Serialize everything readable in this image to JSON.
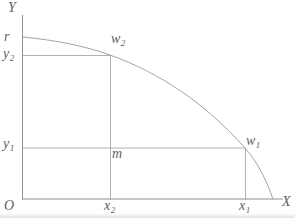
{
  "figure": {
    "background": "#ffffff",
    "axis_color": "#8f8f8f",
    "guide_color": "#9e9e9e",
    "curve_color": "#9a9a9a",
    "text_color": "#5f5f5f",
    "labels": {
      "y_axis": {
        "base": "Y",
        "sub": ""
      },
      "x_axis": {
        "base": "X",
        "sub": ""
      },
      "origin": {
        "base": "O",
        "sub": ""
      },
      "r_intercept": {
        "base": "r",
        "sub": ""
      },
      "y2": {
        "base": "y",
        "sub": "2"
      },
      "y1": {
        "base": "y",
        "sub": "1"
      },
      "x2": {
        "base": "x",
        "sub": "2"
      },
      "x1": {
        "base": "x",
        "sub": "1"
      },
      "w2": {
        "base": "w",
        "sub": "2"
      },
      "w1": {
        "base": "w",
        "sub": "1"
      },
      "m": {
        "base": "m",
        "sub": ""
      }
    }
  }
}
